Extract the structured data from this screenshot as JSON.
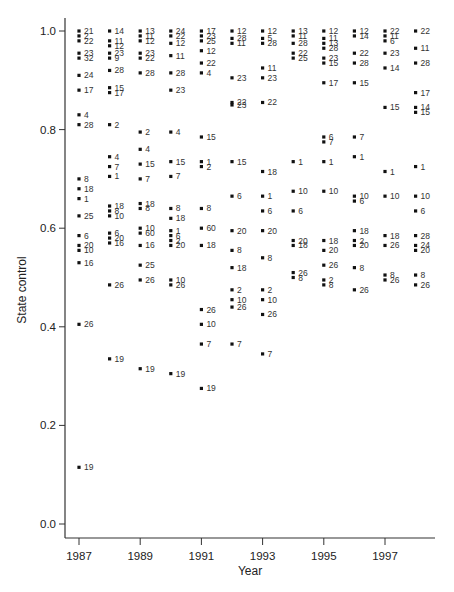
{
  "chart_data": {
    "type": "scatter",
    "title": "",
    "xlabel": "Year",
    "ylabel": "State control",
    "xlim": [
      1986.5,
      1998.7
    ],
    "ylim": [
      -0.03,
      1.02
    ],
    "xticks": [
      1987,
      1989,
      1991,
      1993,
      1995,
      1997
    ],
    "yticks": [
      0.0,
      0.2,
      0.4,
      0.6,
      0.8,
      1.0
    ],
    "ytick_labels": [
      "0.0",
      "0.2",
      "0.4",
      "0.6",
      "0.8",
      "1.0"
    ],
    "grid": false,
    "legend": null,
    "point_label_note": "Each point is annotated with a numeric case ID",
    "points": [
      {
        "x": 1987,
        "y": 1.0,
        "label": "21"
      },
      {
        "x": 1987,
        "y": 0.99,
        "label": "2"
      },
      {
        "x": 1987,
        "y": 0.98,
        "label": "22"
      },
      {
        "x": 1987,
        "y": 0.955,
        "label": "23"
      },
      {
        "x": 1987,
        "y": 0.945,
        "label": "32"
      },
      {
        "x": 1987,
        "y": 0.91,
        "label": "24"
      },
      {
        "x": 1987,
        "y": 0.88,
        "label": "17"
      },
      {
        "x": 1987,
        "y": 0.83,
        "label": "4"
      },
      {
        "x": 1987,
        "y": 0.81,
        "label": "28"
      },
      {
        "x": 1987,
        "y": 0.7,
        "label": "8"
      },
      {
        "x": 1987,
        "y": 0.68,
        "label": "18"
      },
      {
        "x": 1987,
        "y": 0.66,
        "label": "1"
      },
      {
        "x": 1987,
        "y": 0.625,
        "label": "25"
      },
      {
        "x": 1987,
        "y": 0.585,
        "label": "6"
      },
      {
        "x": 1987,
        "y": 0.565,
        "label": "20"
      },
      {
        "x": 1987,
        "y": 0.555,
        "label": "10"
      },
      {
        "x": 1987,
        "y": 0.53,
        "label": "16"
      },
      {
        "x": 1987,
        "y": 0.405,
        "label": "26"
      },
      {
        "x": 1987,
        "y": 0.115,
        "label": "19"
      },
      {
        "x": 1988,
        "y": 1.0,
        "label": "14"
      },
      {
        "x": 1988,
        "y": 0.98,
        "label": "11"
      },
      {
        "x": 1988,
        "y": 0.97,
        "label": "12"
      },
      {
        "x": 1988,
        "y": 0.955,
        "label": "23"
      },
      {
        "x": 1988,
        "y": 0.945,
        "label": "9"
      },
      {
        "x": 1988,
        "y": 0.92,
        "label": "28"
      },
      {
        "x": 1988,
        "y": 0.885,
        "label": "15"
      },
      {
        "x": 1988,
        "y": 0.875,
        "label": "17"
      },
      {
        "x": 1988,
        "y": 0.81,
        "label": "2"
      },
      {
        "x": 1988,
        "y": 0.745,
        "label": "4"
      },
      {
        "x": 1988,
        "y": 0.725,
        "label": "7"
      },
      {
        "x": 1988,
        "y": 0.705,
        "label": "1"
      },
      {
        "x": 1988,
        "y": 0.645,
        "label": "18"
      },
      {
        "x": 1988,
        "y": 0.635,
        "label": "8"
      },
      {
        "x": 1988,
        "y": 0.625,
        "label": "10"
      },
      {
        "x": 1988,
        "y": 0.59,
        "label": "6"
      },
      {
        "x": 1988,
        "y": 0.58,
        "label": "20"
      },
      {
        "x": 1988,
        "y": 0.57,
        "label": "16"
      },
      {
        "x": 1988,
        "y": 0.485,
        "label": "26"
      },
      {
        "x": 1988,
        "y": 0.335,
        "label": "19"
      },
      {
        "x": 1989,
        "y": 1.0,
        "label": "13"
      },
      {
        "x": 1989,
        "y": 0.99,
        "label": "11"
      },
      {
        "x": 1989,
        "y": 0.98,
        "label": "12"
      },
      {
        "x": 1989,
        "y": 0.955,
        "label": "23"
      },
      {
        "x": 1989,
        "y": 0.945,
        "label": "22"
      },
      {
        "x": 1989,
        "y": 0.915,
        "label": "28"
      },
      {
        "x": 1989,
        "y": 0.795,
        "label": "2"
      },
      {
        "x": 1989,
        "y": 0.76,
        "label": "4"
      },
      {
        "x": 1989,
        "y": 0.73,
        "label": "15"
      },
      {
        "x": 1989,
        "y": 0.7,
        "label": "7"
      },
      {
        "x": 1989,
        "y": 0.65,
        "label": "18"
      },
      {
        "x": 1989,
        "y": 0.64,
        "label": "8"
      },
      {
        "x": 1989,
        "y": 0.6,
        "label": "10"
      },
      {
        "x": 1989,
        "y": 0.59,
        "label": "60"
      },
      {
        "x": 1989,
        "y": 0.565,
        "label": "16"
      },
      {
        "x": 1989,
        "y": 0.525,
        "label": "25"
      },
      {
        "x": 1989,
        "y": 0.495,
        "label": "26"
      },
      {
        "x": 1989,
        "y": 0.315,
        "label": "19"
      },
      {
        "x": 1990,
        "y": 1.0,
        "label": "24"
      },
      {
        "x": 1990,
        "y": 0.99,
        "label": "22"
      },
      {
        "x": 1990,
        "y": 0.975,
        "label": "12"
      },
      {
        "x": 1990,
        "y": 0.95,
        "label": "11"
      },
      {
        "x": 1990,
        "y": 0.915,
        "label": "28"
      },
      {
        "x": 1990,
        "y": 0.88,
        "label": "23"
      },
      {
        "x": 1990,
        "y": 0.795,
        "label": "4"
      },
      {
        "x": 1990,
        "y": 0.735,
        "label": "15"
      },
      {
        "x": 1990,
        "y": 0.705,
        "label": "7"
      },
      {
        "x": 1990,
        "y": 0.64,
        "label": "8"
      },
      {
        "x": 1990,
        "y": 0.62,
        "label": "18"
      },
      {
        "x": 1990,
        "y": 0.595,
        "label": "1"
      },
      {
        "x": 1990,
        "y": 0.585,
        "label": "6"
      },
      {
        "x": 1990,
        "y": 0.575,
        "label": "2"
      },
      {
        "x": 1990,
        "y": 0.565,
        "label": "20"
      },
      {
        "x": 1990,
        "y": 0.495,
        "label": "10"
      },
      {
        "x": 1990,
        "y": 0.485,
        "label": "26"
      },
      {
        "x": 1990,
        "y": 0.305,
        "label": "19"
      },
      {
        "x": 1991,
        "y": 1.0,
        "label": "17"
      },
      {
        "x": 1991,
        "y": 0.99,
        "label": "23"
      },
      {
        "x": 1991,
        "y": 0.98,
        "label": "25"
      },
      {
        "x": 1991,
        "y": 0.96,
        "label": "12"
      },
      {
        "x": 1991,
        "y": 0.935,
        "label": "22"
      },
      {
        "x": 1991,
        "y": 0.915,
        "label": "4"
      },
      {
        "x": 1991,
        "y": 0.785,
        "label": "15"
      },
      {
        "x": 1991,
        "y": 0.735,
        "label": "1"
      },
      {
        "x": 1991,
        "y": 0.725,
        "label": "2"
      },
      {
        "x": 1991,
        "y": 0.64,
        "label": "8"
      },
      {
        "x": 1991,
        "y": 0.6,
        "label": "60"
      },
      {
        "x": 1991,
        "y": 0.565,
        "label": "18"
      },
      {
        "x": 1991,
        "y": 0.435,
        "label": "26"
      },
      {
        "x": 1991,
        "y": 0.405,
        "label": "10"
      },
      {
        "x": 1991,
        "y": 0.365,
        "label": "7"
      },
      {
        "x": 1991,
        "y": 0.275,
        "label": "19"
      },
      {
        "x": 1992,
        "y": 1.0,
        "label": "12"
      },
      {
        "x": 1992,
        "y": 0.985,
        "label": "28"
      },
      {
        "x": 1992,
        "y": 0.975,
        "label": "11"
      },
      {
        "x": 1992,
        "y": 0.905,
        "label": "23"
      },
      {
        "x": 1992,
        "y": 0.855,
        "label": "22"
      },
      {
        "x": 1992,
        "y": 0.85,
        "label": "23"
      },
      {
        "x": 1992,
        "y": 0.735,
        "label": "15"
      },
      {
        "x": 1992,
        "y": 0.665,
        "label": "6"
      },
      {
        "x": 1992,
        "y": 0.595,
        "label": "20"
      },
      {
        "x": 1992,
        "y": 0.555,
        "label": "8"
      },
      {
        "x": 1992,
        "y": 0.52,
        "label": "18"
      },
      {
        "x": 1992,
        "y": 0.475,
        "label": "2"
      },
      {
        "x": 1992,
        "y": 0.455,
        "label": "10"
      },
      {
        "x": 1992,
        "y": 0.44,
        "label": "26"
      },
      {
        "x": 1992,
        "y": 0.365,
        "label": "7"
      },
      {
        "x": 1993,
        "y": 1.0,
        "label": "12"
      },
      {
        "x": 1993,
        "y": 0.985,
        "label": "5"
      },
      {
        "x": 1993,
        "y": 0.975,
        "label": "28"
      },
      {
        "x": 1993,
        "y": 0.925,
        "label": "11"
      },
      {
        "x": 1993,
        "y": 0.905,
        "label": "23"
      },
      {
        "x": 1993,
        "y": 0.855,
        "label": "22"
      },
      {
        "x": 1993,
        "y": 0.715,
        "label": "18"
      },
      {
        "x": 1993,
        "y": 0.665,
        "label": "1"
      },
      {
        "x": 1993,
        "y": 0.635,
        "label": "6"
      },
      {
        "x": 1993,
        "y": 0.595,
        "label": "20"
      },
      {
        "x": 1993,
        "y": 0.54,
        "label": "8"
      },
      {
        "x": 1993,
        "y": 0.475,
        "label": "2"
      },
      {
        "x": 1993,
        "y": 0.455,
        "label": "10"
      },
      {
        "x": 1993,
        "y": 0.425,
        "label": "26"
      },
      {
        "x": 1993,
        "y": 0.345,
        "label": "7"
      },
      {
        "x": 1994,
        "y": 1.0,
        "label": "13"
      },
      {
        "x": 1994,
        "y": 0.99,
        "label": "11"
      },
      {
        "x": 1994,
        "y": 0.975,
        "label": "28"
      },
      {
        "x": 1994,
        "y": 0.955,
        "label": "22"
      },
      {
        "x": 1994,
        "y": 0.945,
        "label": "25"
      },
      {
        "x": 1994,
        "y": 0.735,
        "label": "1"
      },
      {
        "x": 1994,
        "y": 0.675,
        "label": "10"
      },
      {
        "x": 1994,
        "y": 0.635,
        "label": "6"
      },
      {
        "x": 1994,
        "y": 0.575,
        "label": "20"
      },
      {
        "x": 1994,
        "y": 0.565,
        "label": "18"
      },
      {
        "x": 1994,
        "y": 0.51,
        "label": "26"
      },
      {
        "x": 1994,
        "y": 0.5,
        "label": "8"
      },
      {
        "x": 1995,
        "y": 1.0,
        "label": "12"
      },
      {
        "x": 1995,
        "y": 0.985,
        "label": "11"
      },
      {
        "x": 1995,
        "y": 0.975,
        "label": "13"
      },
      {
        "x": 1995,
        "y": 0.965,
        "label": "28"
      },
      {
        "x": 1995,
        "y": 0.945,
        "label": "23"
      },
      {
        "x": 1995,
        "y": 0.935,
        "label": "15"
      },
      {
        "x": 1995,
        "y": 0.895,
        "label": "17"
      },
      {
        "x": 1995,
        "y": 0.785,
        "label": "6"
      },
      {
        "x": 1995,
        "y": 0.775,
        "label": "7"
      },
      {
        "x": 1995,
        "y": 0.735,
        "label": "1"
      },
      {
        "x": 1995,
        "y": 0.675,
        "label": "10"
      },
      {
        "x": 1995,
        "y": 0.575,
        "label": "18"
      },
      {
        "x": 1995,
        "y": 0.555,
        "label": "20"
      },
      {
        "x": 1995,
        "y": 0.525,
        "label": "26"
      },
      {
        "x": 1995,
        "y": 0.495,
        "label": "2"
      },
      {
        "x": 1995,
        "y": 0.485,
        "label": "8"
      },
      {
        "x": 1996,
        "y": 1.0,
        "label": "12"
      },
      {
        "x": 1996,
        "y": 0.99,
        "label": "14"
      },
      {
        "x": 1996,
        "y": 0.955,
        "label": "22"
      },
      {
        "x": 1996,
        "y": 0.935,
        "label": "28"
      },
      {
        "x": 1996,
        "y": 0.895,
        "label": "15"
      },
      {
        "x": 1996,
        "y": 0.785,
        "label": "7"
      },
      {
        "x": 1996,
        "y": 0.745,
        "label": "1"
      },
      {
        "x": 1996,
        "y": 0.665,
        "label": "10"
      },
      {
        "x": 1996,
        "y": 0.655,
        "label": "6"
      },
      {
        "x": 1996,
        "y": 0.595,
        "label": "18"
      },
      {
        "x": 1996,
        "y": 0.575,
        "label": "2"
      },
      {
        "x": 1996,
        "y": 0.565,
        "label": "20"
      },
      {
        "x": 1996,
        "y": 0.52,
        "label": "8"
      },
      {
        "x": 1996,
        "y": 0.475,
        "label": "26"
      },
      {
        "x": 1997,
        "y": 1.0,
        "label": "22"
      },
      {
        "x": 1997,
        "y": 0.99,
        "label": "11"
      },
      {
        "x": 1997,
        "y": 0.98,
        "label": "6"
      },
      {
        "x": 1997,
        "y": 0.955,
        "label": "23"
      },
      {
        "x": 1997,
        "y": 0.925,
        "label": "14"
      },
      {
        "x": 1997,
        "y": 0.845,
        "label": "15"
      },
      {
        "x": 1997,
        "y": 0.715,
        "label": "1"
      },
      {
        "x": 1997,
        "y": 0.665,
        "label": "10"
      },
      {
        "x": 1997,
        "y": 0.585,
        "label": "18"
      },
      {
        "x": 1997,
        "y": 0.565,
        "label": "26"
      },
      {
        "x": 1997,
        "y": 0.505,
        "label": "8"
      },
      {
        "x": 1997,
        "y": 0.495,
        "label": "26"
      },
      {
        "x": 1998,
        "y": 1.0,
        "label": "22"
      },
      {
        "x": 1998,
        "y": 0.965,
        "label": "11"
      },
      {
        "x": 1998,
        "y": 0.935,
        "label": "28"
      },
      {
        "x": 1998,
        "y": 0.875,
        "label": "17"
      },
      {
        "x": 1998,
        "y": 0.845,
        "label": "14"
      },
      {
        "x": 1998,
        "y": 0.835,
        "label": "15"
      },
      {
        "x": 1998,
        "y": 0.725,
        "label": "1"
      },
      {
        "x": 1998,
        "y": 0.665,
        "label": "10"
      },
      {
        "x": 1998,
        "y": 0.635,
        "label": "6"
      },
      {
        "x": 1998,
        "y": 0.585,
        "label": "28"
      },
      {
        "x": 1998,
        "y": 0.565,
        "label": "24"
      },
      {
        "x": 1998,
        "y": 0.555,
        "label": "20"
      },
      {
        "x": 1998,
        "y": 0.505,
        "label": "8"
      },
      {
        "x": 1998,
        "y": 0.485,
        "label": "26"
      }
    ]
  },
  "layout": {
    "plot_left": 65,
    "plot_right": 435,
    "plot_top": 18,
    "axis_y": 538,
    "x_px_1987": 79,
    "x_px_per_year": 30.6,
    "y_px_zero": 524,
    "y_px_per_unit": 493
  }
}
